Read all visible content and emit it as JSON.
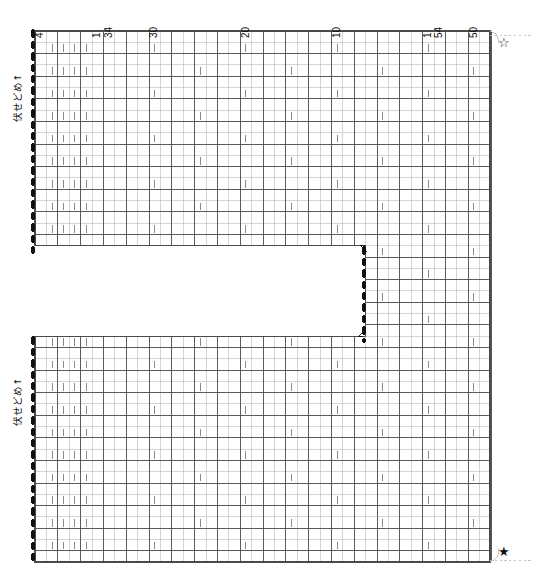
{
  "chart": {
    "type": "knitting-pattern-grid",
    "colors": {
      "grid_minor": "#b9b9b9",
      "grid_major": "#4a4a4a",
      "stitch_mark": "#8a8a8a",
      "edge_dot": "#111111",
      "guide_line": "#bfbfbf",
      "background": "#ffffff",
      "text": "#111111"
    },
    "geometry": {
      "cell_width": 11.4,
      "cell_height": 11.3,
      "grid_left": 35,
      "grid_top": 31,
      "grid_right": 490,
      "grid_bottom": 562,
      "columns": 40,
      "rows": 47,
      "major_column_every": 2,
      "major_row_every": 2,
      "notch": {
        "left_col": 29,
        "top_row": 19,
        "bottom_row": 27,
        "description": "Open rectangle between the upper and lower sections, open toward the left edge"
      },
      "upper_section_rows": [
        0,
        19
      ],
      "lower_section_rows": [
        27,
        47
      ],
      "lower_section_left_gap_rows": [
        19,
        27
      ]
    },
    "column_labels": [
      {
        "text": "4",
        "col": 0
      },
      {
        "text": "1",
        "col": 5
      },
      {
        "text": "34",
        "col": 6
      },
      {
        "text": "30",
        "col": 10
      },
      {
        "text": "20",
        "col": 18
      },
      {
        "text": "10",
        "col": 26
      },
      {
        "text": "1",
        "col": 34
      },
      {
        "text": "54",
        "col": 35
      },
      {
        "text": "50",
        "col": 38
      },
      {
        "text": "43",
        "col": 44
      }
    ],
    "side_labels": [
      {
        "text": "伏せどめ↑",
        "position": "upper-left",
        "meaning": "bind-off / cast-off, worked upward"
      },
      {
        "text": "伏せどめ↑",
        "position": "lower-left",
        "meaning": "bind-off / cast-off, worked upward"
      }
    ],
    "markers": [
      {
        "name": "hollow-star",
        "glyph": "☆",
        "position": "top-right",
        "x": 498,
        "y": 36
      },
      {
        "name": "filled-star",
        "glyph": "★",
        "position": "bottom-right",
        "x": 498,
        "y": 545
      }
    ],
    "edge_dots": {
      "description": "Heavy dashed/dotted line marking the bind-off edge",
      "segments": [
        {
          "x": 33,
          "y_start": 31,
          "y_end": 258
        },
        {
          "x": 33,
          "y_start": 338,
          "y_end": 562
        },
        {
          "x": 364,
          "y_start": 248,
          "y_end": 341
        }
      ]
    },
    "stitch_symbol": {
      "name": "purl-bar",
      "glyph": "|",
      "meaning": "vertical bar symbol marking a patterned stitch cell"
    },
    "legend_note": "Left columns 1-4 of every patterned row carry the bar symbol; interior bars repeat every 8 columns with a 2-row offset."
  }
}
